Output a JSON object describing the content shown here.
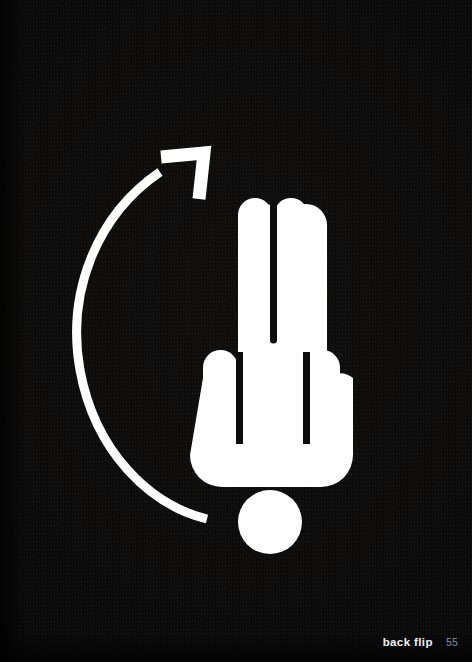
{
  "page": {
    "width": 472,
    "height": 662,
    "background_color": "#0a0908",
    "ink_color": "#ffffff"
  },
  "footer": {
    "caption": "back flip",
    "folio": "55",
    "caption_color": "#f2f2f2",
    "folio_color": "#8d8d8d"
  },
  "artwork": {
    "title": "back flip",
    "description": "White pictogram of a raised hand forming an exclamation mark, with a curved arrow sweeping counterclockwise around its left side",
    "glyphs": [
      {
        "name": "hand-exclamation-glyph",
        "color": "#ffffff"
      },
      {
        "name": "exclamation-dot",
        "color": "#ffffff"
      },
      {
        "name": "curved-arrow",
        "color": "#ffffff"
      }
    ],
    "hand": {
      "finger_count": 4,
      "tall_finger_top_y": 198,
      "short_finger_top_y": 350,
      "palm_bottom_y": 483,
      "left_x": 203,
      "right_x": 340
    },
    "dot": {
      "center_x": 270,
      "center_y": 522,
      "radius": 32
    },
    "arrow": {
      "direction": "counterclockwise",
      "tail_x": 207,
      "tail_y": 518,
      "head_x": 195,
      "head_y": 165,
      "stroke_width": 9
    }
  }
}
